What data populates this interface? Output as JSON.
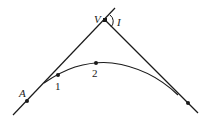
{
  "diagram": {
    "type": "horizontal curve with tangents",
    "colors": {
      "stroke": "#1a1a1a",
      "background": "#ffffff"
    },
    "labels": {
      "A": "A",
      "V": "V",
      "I": "I",
      "p1": "1",
      "p2": "2"
    },
    "points": {
      "A": [
        27,
        101
      ],
      "V": [
        105,
        20
      ],
      "p1": [
        58,
        75
      ],
      "p2": [
        96,
        63
      ],
      "end": [
        188,
        103
      ]
    }
  }
}
